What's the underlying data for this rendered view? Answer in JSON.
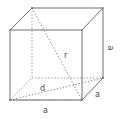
{
  "figure": {
    "type": "geometry-diagram",
    "shape": "cube",
    "stroke_color": "#6e6e6e",
    "dotted_color": "#8c8c8c",
    "label_color": "#4a4a4a",
    "background": "#ffffff",
    "vertices": {
      "front_top_left": [
        10,
        30
      ],
      "front_top_right": [
        82,
        30
      ],
      "front_bottom_right": [
        82,
        100
      ],
      "front_bottom_left": [
        10,
        100
      ],
      "back_top_left": [
        32,
        8
      ],
      "back_top_right": [
        103,
        8
      ],
      "back_bottom_right": [
        103,
        78
      ],
      "back_bottom_left": [
        32,
        78
      ]
    },
    "labels": {
      "edge_right": "a",
      "edge_bottom": "a",
      "edge_depth": "a",
      "space_diagonal": "r",
      "face_diagonal": "d"
    }
  }
}
